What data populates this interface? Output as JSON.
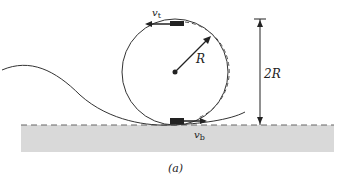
{
  "figure": {
    "caption": "(a)",
    "labels": {
      "top_velocity": "v",
      "top_velocity_sub": "t",
      "bottom_velocity": "v",
      "bottom_velocity_sub": "b",
      "radius": "R",
      "height": "2R"
    },
    "colors": {
      "ground": "#d9d9d9",
      "line": "#222222",
      "dash": "#666666"
    }
  }
}
